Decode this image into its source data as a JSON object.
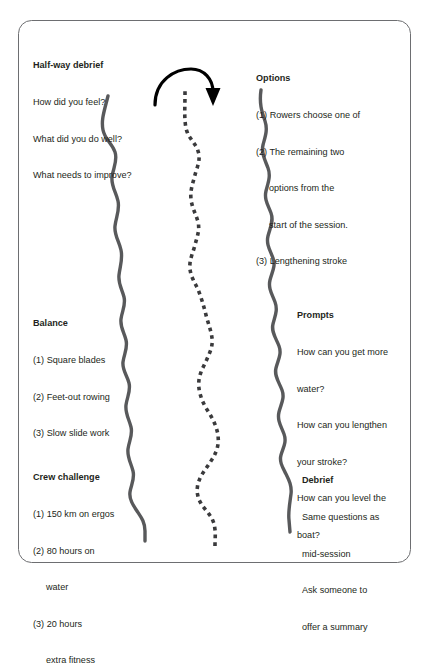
{
  "figure": {
    "type": "flow-diagram",
    "border_color": "#58595b",
    "text_color": "#231f20",
    "river_color": "#58595b",
    "dotted_color": "#3a3a3c",
    "arrow_color": "#000000",
    "background": "#ffffff"
  },
  "blocks": {
    "halfway": {
      "title": "Half-way debrief",
      "lines": [
        "How did you feel?",
        "What did you do well?",
        "What needs to improve?"
      ]
    },
    "options": {
      "title": "Options",
      "lines": [
        "(1) Rowers choose one of",
        "(2) The remaining two",
        "options from the",
        "start of the session.",
        "(3) Lengthening stroke"
      ]
    },
    "balance": {
      "title": "Balance",
      "lines": [
        "(1) Square blades",
        "(2) Feet-out rowing",
        "(3) Slow slide work"
      ]
    },
    "prompts": {
      "title": "Prompts",
      "lines": [
        "How can you get more",
        "water?",
        "How can you lengthen",
        "your stroke?",
        "How can you level the",
        "boat?"
      ]
    },
    "crew": {
      "title": "Crew challenge",
      "lines": [
        "(1) 150 km on ergos",
        "(2) 80 hours on",
        "water",
        "(3) 20 hours",
        "extra fitness"
      ]
    },
    "debrief": {
      "title": "Debrief",
      "lines": [
        "Same questions as",
        "mid-session",
        "Ask someone to",
        "offer a summary"
      ]
    }
  },
  "graphics": {
    "arrow_name": "curved-arrow-right",
    "left_bank_name": "left-river-bank",
    "right_bank_name": "right-river-bank",
    "center_name": "dotted-center-line"
  }
}
